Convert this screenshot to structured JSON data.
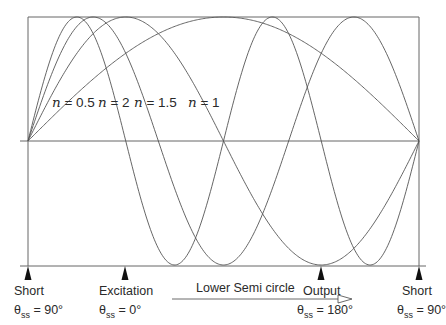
{
  "diagram": {
    "frame": {
      "left": 28,
      "right": 419,
      "top": 17,
      "middle": 141,
      "bottom": 266
    },
    "curves": [
      {
        "n": "0.5",
        "label": "n = 0.5",
        "half_periods": 1
      },
      {
        "n": "1",
        "label": "n = 1",
        "half_periods": 2
      },
      {
        "n": "1.5",
        "label": "n = 1.5",
        "half_periods": 3
      },
      {
        "n": "2",
        "label": "n = 2",
        "half_periods": 4
      }
    ],
    "curve_labels": [
      {
        "var": "n",
        "text": " = 0.5",
        "x": 52,
        "y": 94
      },
      {
        "var": "n",
        "text": " = 2",
        "x": 98,
        "y": 94
      },
      {
        "var": "n",
        "text": " = 1.5",
        "x": 134,
        "y": 94
      },
      {
        "var": "n",
        "text": " = 1",
        "x": 188,
        "y": 94
      }
    ],
    "markers": [
      {
        "name": "Short",
        "x": 28,
        "theta_sym": "θ",
        "theta_sub": "ss",
        "theta_val": " = 90°"
      },
      {
        "name": "Excitation",
        "x": 125,
        "theta_sym": "θ",
        "theta_sub": "ss",
        "theta_val": " = 0°"
      },
      {
        "name": "Output",
        "x": 321,
        "theta_sym": "θ",
        "theta_sub": "ss",
        "theta_val": " = 180°"
      },
      {
        "name": "Short",
        "x": 419,
        "theta_sym": "θ",
        "theta_sub": "ss",
        "theta_val": " = 90°"
      }
    ],
    "arrow_label": "Lower Semi circle",
    "line_color": "#555555"
  }
}
